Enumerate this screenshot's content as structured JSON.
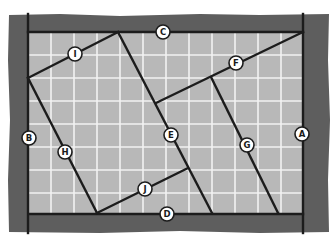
{
  "diagram": {
    "type": "floor-plan",
    "colors": {
      "frame": "#5e5e5e",
      "field": "#b8b8b8",
      "grid": "#f2f2f2",
      "line": "#1c1c1c",
      "label_fill": "#ffffff"
    },
    "labels": {
      "A": "A",
      "B": "B",
      "C": "C",
      "D": "D",
      "E": "E",
      "F": "F",
      "G": "G",
      "H": "H",
      "I": "I",
      "J": "J"
    }
  }
}
